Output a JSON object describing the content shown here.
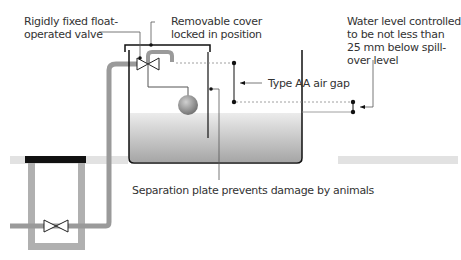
{
  "diagram": {
    "labels": {
      "valve": [
        "Rigidly fixed float-",
        "operated valve"
      ],
      "cover": [
        "Removable cover",
        "locked in position"
      ],
      "water_level": [
        "Water level controlled",
        "to be not less than",
        "25 mm below spill-",
        "over level"
      ],
      "air_gap": "Type AA air gap",
      "separation_plate": "Separation plate prevents damage by animals"
    },
    "colors": {
      "pipe": "#9a9a9a",
      "line": "#222222",
      "water_top": "#e6e6e6",
      "water_bottom": "#a8a8a8",
      "ground_cover": "#111111",
      "text": "#333333"
    }
  }
}
